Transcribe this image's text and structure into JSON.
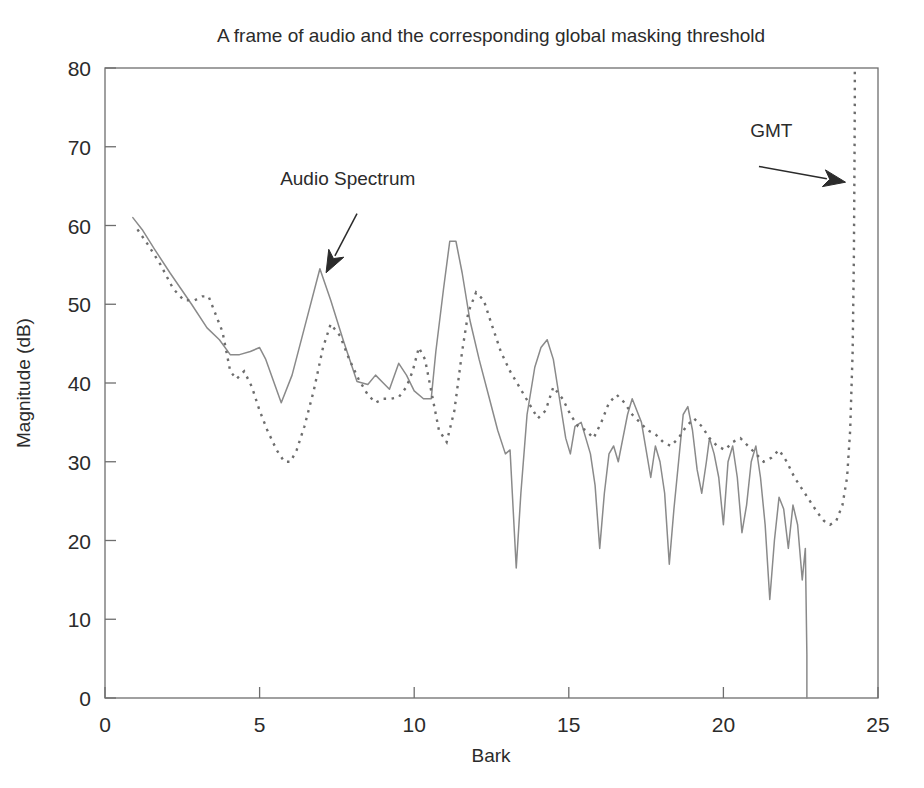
{
  "figure": {
    "title": "A frame of audio and the corresponding global masking threshold",
    "background_color": "#ffffff",
    "axis_color": "#6e6e6e",
    "solid_color": "#8a8a8a",
    "dotted_color": "#6d6d6d"
  },
  "chart_data": {
    "type": "line",
    "title": "A frame of audio and the corresponding global masking threshold",
    "xlabel": "Bark",
    "ylabel": "Magnitude (dB)",
    "xlim": [
      0,
      25
    ],
    "ylim": [
      0,
      80
    ],
    "xticks": [
      0,
      5,
      10,
      15,
      20,
      25
    ],
    "yticks": [
      0,
      10,
      20,
      30,
      40,
      50,
      60,
      70,
      80
    ],
    "xtick_labels": [
      "0",
      "5",
      "10",
      "15",
      "20",
      "25"
    ],
    "ytick_labels": [
      "0",
      "10",
      "20",
      "30",
      "40",
      "50",
      "60",
      "70",
      "80"
    ],
    "grid": false,
    "legend": "none",
    "annotations": [
      {
        "text": "Audio Spectrum",
        "text_x": 7.85,
        "text_y": 65.2,
        "arrow_from": [
          8.15,
          61.5
        ],
        "arrow_to": [
          7.15,
          54.0
        ]
      },
      {
        "text": "GMT",
        "text_x": 21.55,
        "text_y": 71.2,
        "arrow_from": [
          21.15,
          67.5
        ],
        "arrow_to": [
          23.95,
          65.5
        ]
      }
    ],
    "series": [
      {
        "name": "Audio Spectrum",
        "style": "solid",
        "color": "#8a8a8a",
        "x": [
          0.9,
          1.2,
          1.6,
          2.1,
          2.45,
          2.8,
          3.3,
          3.7,
          4.05,
          4.35,
          4.7,
          5.0,
          5.2,
          5.7,
          6.05,
          6.45,
          6.95,
          7.3,
          7.7,
          8.15,
          8.5,
          8.75,
          9.0,
          9.2,
          9.5,
          9.75,
          10.0,
          10.3,
          10.55,
          10.7,
          10.95,
          11.15,
          11.35,
          11.55,
          11.8,
          12.1,
          12.4,
          12.7,
          12.95,
          13.1,
          13.3,
          13.45,
          13.65,
          13.9,
          14.1,
          14.3,
          14.5,
          14.7,
          14.9,
          15.05,
          15.2,
          15.4,
          15.55,
          15.7,
          15.85,
          16.0,
          16.15,
          16.3,
          16.45,
          16.6,
          16.75,
          16.9,
          17.05,
          17.2,
          17.35,
          17.5,
          17.65,
          17.8,
          17.95,
          18.1,
          18.25,
          18.4,
          18.55,
          18.7,
          18.85,
          19.0,
          19.15,
          19.3,
          19.45,
          19.55,
          19.7,
          19.85,
          20.0,
          20.15,
          20.3,
          20.45,
          20.6,
          20.75,
          20.9,
          21.05,
          21.2,
          21.35,
          21.5,
          21.65,
          21.8,
          21.95,
          22.1,
          22.25,
          22.4,
          22.55,
          22.65,
          22.7,
          22.7
        ],
        "y": [
          61.0,
          59.5,
          57.0,
          54.0,
          52.0,
          50.0,
          47.0,
          45.5,
          43.6,
          43.6,
          44.0,
          44.5,
          43.0,
          37.5,
          41.0,
          47.0,
          54.5,
          50.5,
          45.5,
          40.2,
          39.8,
          41.0,
          40.0,
          39.2,
          42.5,
          41.0,
          39.0,
          38.0,
          38.0,
          44.0,
          52.0,
          58.0,
          58.0,
          54.0,
          48.0,
          43.0,
          38.5,
          34.0,
          31.0,
          31.5,
          16.5,
          26.0,
          36.0,
          42.0,
          44.5,
          45.5,
          43.0,
          38.0,
          33.0,
          31.0,
          34.5,
          35.0,
          33.0,
          31.0,
          27.0,
          19.0,
          26.0,
          31.0,
          32.0,
          30.0,
          33.0,
          36.0,
          38.0,
          36.5,
          35.0,
          31.5,
          28.0,
          32.0,
          30.0,
          26.0,
          17.0,
          24.0,
          30.0,
          36.0,
          37.0,
          34.0,
          29.0,
          26.0,
          30.0,
          33.0,
          31.0,
          28.0,
          22.0,
          30.0,
          32.0,
          28.0,
          21.0,
          24.5,
          30.0,
          32.0,
          28.0,
          22.0,
          12.5,
          20.0,
          25.5,
          24.0,
          19.0,
          24.5,
          22.0,
          15.0,
          19.0,
          5.5,
          0.0
        ]
      },
      {
        "name": "GMT",
        "style": "dotted",
        "color": "#6d6d6d",
        "x": [
          1.05,
          1.4,
          1.8,
          2.2,
          2.55,
          2.9,
          3.15,
          3.35,
          3.55,
          3.8,
          4.05,
          4.25,
          4.5,
          4.75,
          5.0,
          5.25,
          5.55,
          5.8,
          6.0,
          6.2,
          6.45,
          6.75,
          7.05,
          7.3,
          7.6,
          7.9,
          8.2,
          8.5,
          8.75,
          9.0,
          9.25,
          9.5,
          9.75,
          9.95,
          10.15,
          10.35,
          10.55,
          10.8,
          11.05,
          11.3,
          11.55,
          11.75,
          12.0,
          12.25,
          12.5,
          12.8,
          13.1,
          13.4,
          13.7,
          14.0,
          14.25,
          14.5,
          14.8,
          15.05,
          15.3,
          15.55,
          15.8,
          16.05,
          16.3,
          16.55,
          16.8,
          17.05,
          17.3,
          17.55,
          17.8,
          18.05,
          18.3,
          18.55,
          18.8,
          19.05,
          19.3,
          19.55,
          19.8,
          20.05,
          20.3,
          20.55,
          20.8,
          21.05,
          21.3,
          21.55,
          21.8,
          22.05,
          22.3,
          22.55,
          22.8,
          23.05,
          23.25,
          23.45,
          23.65,
          23.85,
          24.0,
          24.1,
          24.18,
          24.22,
          24.24,
          24.25,
          24.25
        ],
        "y": [
          59.5,
          57.5,
          55.0,
          52.0,
          50.5,
          50.5,
          51.0,
          51.0,
          49.0,
          46.5,
          41.5,
          40.5,
          41.5,
          39.5,
          36.5,
          34.0,
          31.5,
          30.0,
          30.0,
          31.5,
          34.5,
          39.0,
          44.5,
          47.5,
          46.0,
          43.0,
          40.5,
          38.5,
          37.5,
          38.0,
          38.0,
          38.2,
          39.5,
          41.5,
          44.5,
          43.0,
          39.0,
          34.0,
          32.5,
          36.5,
          44.0,
          49.0,
          51.5,
          50.5,
          47.5,
          44.0,
          41.5,
          39.5,
          37.5,
          35.5,
          36.5,
          39.5,
          38.0,
          36.0,
          34.5,
          34.0,
          33.0,
          35.0,
          37.5,
          38.5,
          37.5,
          36.0,
          35.0,
          34.0,
          33.5,
          32.5,
          32.0,
          33.0,
          34.5,
          35.5,
          34.5,
          33.0,
          32.0,
          31.5,
          32.5,
          33.0,
          32.0,
          31.0,
          30.0,
          30.5,
          31.5,
          30.0,
          28.0,
          26.5,
          25.0,
          23.5,
          22.5,
          22.0,
          22.5,
          24.5,
          28.0,
          34.0,
          44.0,
          56.0,
          68.0,
          76.0,
          80.0
        ]
      }
    ]
  }
}
